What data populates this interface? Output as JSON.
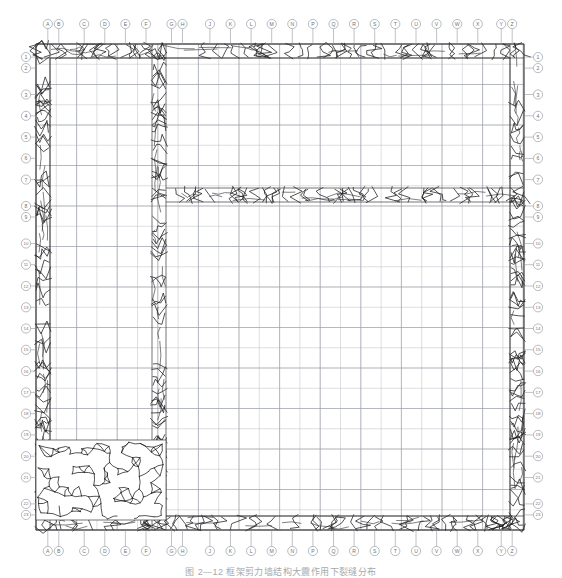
{
  "figure": {
    "caption": "图 2—12  框架剪力墙结构大震作用下裂缝分布",
    "background_color": "#ffffff",
    "crack_color": "#1b1b1b",
    "grid_color": "#b9bcc2",
    "leader_color": "#8a8f96",
    "bubble_fill": "#ffffff"
  },
  "axes": {
    "top": {
      "name": "top-axis",
      "labels": [
        "A",
        "B",
        "C",
        "D",
        "E",
        "F",
        "G",
        "H",
        "J",
        "K",
        "L",
        "M",
        "N",
        "P",
        "Q",
        "R",
        "S",
        "T",
        "U",
        "V",
        "W",
        "X",
        "Y",
        "Z"
      ]
    },
    "bottom": {
      "name": "bottom-axis",
      "labels": [
        "A",
        "B",
        "C",
        "D",
        "E",
        "F",
        "G",
        "H",
        "J",
        "K",
        "L",
        "M",
        "N",
        "P",
        "Q",
        "R",
        "S",
        "T",
        "U",
        "V",
        "W",
        "X",
        "Y",
        "Z"
      ]
    },
    "left": {
      "name": "left-axis",
      "labels": [
        "1",
        "2",
        "3",
        "4",
        "5",
        "6",
        "7",
        "8",
        "9",
        "10",
        "11",
        "12",
        "13",
        "14",
        "15",
        "16",
        "17",
        "18",
        "19",
        "20",
        "21",
        "22",
        "23"
      ]
    },
    "right": {
      "name": "right-axis",
      "labels": [
        "1",
        "2",
        "3",
        "4",
        "5",
        "6",
        "7",
        "8",
        "9",
        "10",
        "11",
        "12",
        "13",
        "14",
        "15",
        "16",
        "17",
        "18",
        "19",
        "20",
        "21",
        "22",
        "23"
      ]
    }
  },
  "model": {
    "type": "finite-element-crack-pattern",
    "plan_extent": {
      "x0": 36,
      "y0": 44,
      "x1": 524,
      "y1": 530
    },
    "mesh": {
      "cell_size_x": 20.3,
      "cell_size_y": 20.25,
      "visible": true
    },
    "walls": [
      {
        "name": "north-exterior-wall",
        "x": 36,
        "y": 44,
        "w": 488,
        "h": 14,
        "damage": "heavy"
      },
      {
        "name": "south-exterior-wall",
        "x": 36,
        "y": 516,
        "w": 488,
        "h": 14,
        "damage": "heavy"
      },
      {
        "name": "west-exterior-wall",
        "x": 36,
        "y": 44,
        "w": 14,
        "h": 486,
        "damage": "heavy"
      },
      {
        "name": "east-exterior-wall",
        "x": 510,
        "y": 44,
        "w": 14,
        "h": 486,
        "damage": "heavy"
      },
      {
        "name": "interior-longitudinal-wall",
        "x": 152,
        "y": 44,
        "w": 14,
        "h": 486,
        "damage": "heavy"
      },
      {
        "name": "interior-transverse-wall",
        "x": 166,
        "y": 188,
        "w": 358,
        "h": 14,
        "damage": "heavy"
      }
    ],
    "zones": [
      {
        "name": "severe-damage-zone",
        "x": 36,
        "y": 440,
        "w": 130,
        "h": 80,
        "density": "very-high",
        "label": "crushed region"
      }
    ]
  }
}
